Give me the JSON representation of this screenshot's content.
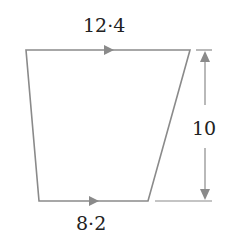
{
  "figure": {
    "type": "trapezium",
    "labels": {
      "top_side": "12·4",
      "bottom_side": "8·2",
      "height": "10"
    },
    "colors": {
      "line": "#8a8a8a",
      "text": "#222222",
      "background": "#ffffff"
    },
    "annotations": {
      "parallel_arrows": "top and bottom sides marked with single arrows indicating they are parallel",
      "height_dimension": "double-headed vertical arrow on the right spanning top to bottom"
    }
  }
}
